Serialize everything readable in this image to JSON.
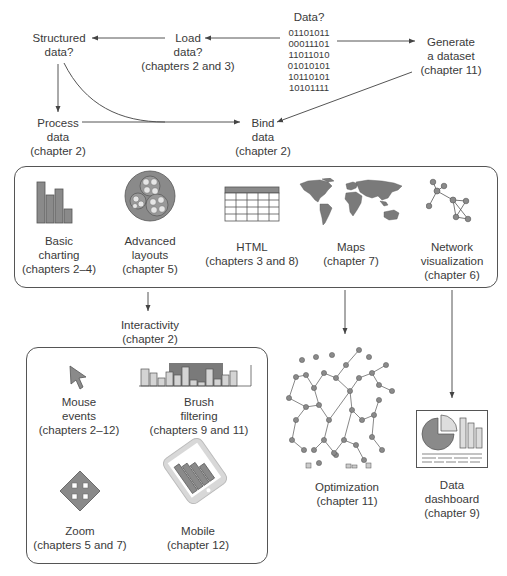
{
  "flow": {
    "data_question": "Data?",
    "binary": [
      "01101011",
      "00011101",
      "11011010",
      "01010101",
      "10110101",
      "10101111"
    ],
    "structured": [
      "Structured",
      "data?"
    ],
    "load": [
      "Load",
      "data?",
      "(chapters 2 and 3)"
    ],
    "generate": [
      "Generate",
      "a dataset",
      "(chapter 11)"
    ],
    "process": [
      "Process",
      "data",
      "(chapter 2)"
    ],
    "bind": [
      "Bind",
      "data",
      "(chapter 2)"
    ]
  },
  "visualizations": [
    {
      "name": "basic-charting",
      "label": [
        "Basic",
        "charting",
        "(chapters 2–4)"
      ]
    },
    {
      "name": "advanced-layouts",
      "label": [
        "Advanced",
        "layouts",
        "(chapter 5)"
      ]
    },
    {
      "name": "html",
      "label": [
        "HTML",
        "(chapters 3 and 8)"
      ]
    },
    {
      "name": "maps",
      "label": [
        "Maps",
        "(chapter 7)"
      ]
    },
    {
      "name": "network-visualization",
      "label": [
        "Network",
        "visualization",
        "(chapter 6)"
      ]
    }
  ],
  "interactivity": {
    "title": [
      "Interactivity",
      "(chapter 2)"
    ],
    "items": [
      {
        "name": "mouse-events",
        "label": [
          "Mouse",
          "events",
          "(chapters 2–12)"
        ]
      },
      {
        "name": "brush-filtering",
        "label": [
          "Brush",
          "filtering",
          "(chapters 9 and 11)"
        ]
      },
      {
        "name": "zoom",
        "label": [
          "Zoom",
          "(chapters 5 and 7)"
        ]
      },
      {
        "name": "mobile",
        "label": [
          "Mobile",
          "(chapter 12)"
        ]
      }
    ]
  },
  "optimization": {
    "label": [
      "Optimization",
      "(chapter 11)"
    ]
  },
  "dashboard": {
    "label": [
      "Data",
      "dashboard",
      "(chapter 9)"
    ]
  },
  "colors": {
    "icon_fill": "#8a8a8a",
    "icon_light": "#cfcfcf",
    "line": "#555555"
  }
}
